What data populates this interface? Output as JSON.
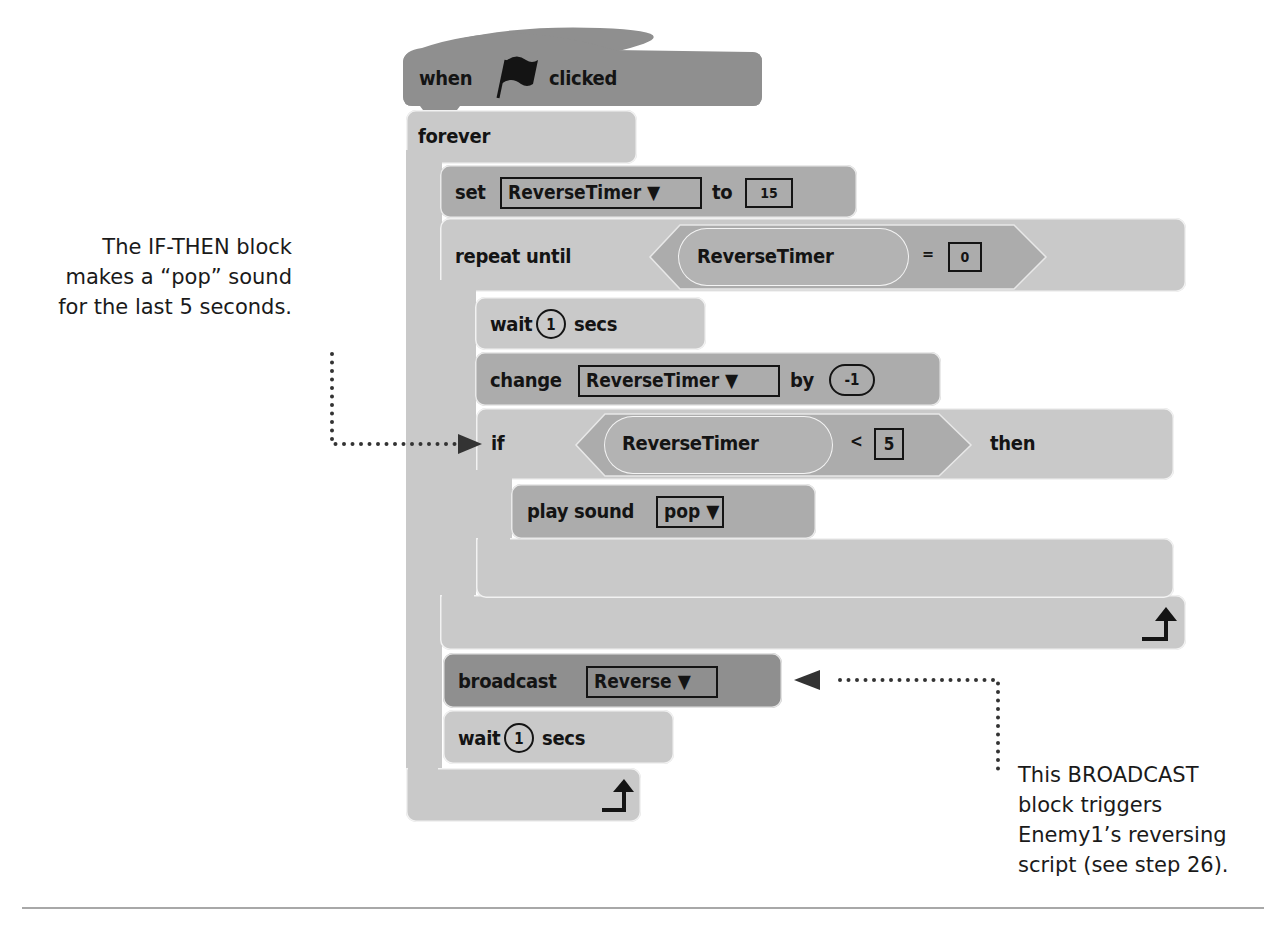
{
  "script": {
    "hat": {
      "when": "when",
      "icon": "green-flag-icon",
      "clicked": "clicked"
    },
    "forever": {
      "label": "forever"
    },
    "set": {
      "label": "set",
      "variable": "ReverseTimer ▼",
      "to": "to",
      "value": "15"
    },
    "repeat_until": {
      "label": "repeat until",
      "condition": {
        "reporter": "ReverseTimer",
        "operator": "=",
        "value": "0"
      }
    },
    "wait_inner": {
      "label": "wait",
      "value": "1",
      "unit": "secs"
    },
    "change": {
      "label": "change",
      "variable": "ReverseTimer ▼",
      "by": "by",
      "value": "-1"
    },
    "if_then": {
      "if": "if",
      "condition": {
        "reporter": "ReverseTimer",
        "operator": "<",
        "value": "5"
      },
      "then": "then"
    },
    "play_sound": {
      "label": "play sound",
      "sound": "pop ▼"
    },
    "broadcast": {
      "label": "broadcast",
      "message": "Reverse ▼"
    },
    "wait_outer": {
      "label": "wait",
      "value": "1",
      "unit": "secs"
    },
    "loop_icon": "loop-arrow-icon"
  },
  "annotations": {
    "left": {
      "lines": [
        "The IF-THEN block",
        "makes a “pop” sound",
        "for the last 5 seconds."
      ]
    },
    "right": {
      "lines": [
        "This BROADCAST",
        "block triggers",
        "Enemy1’s reversing",
        "script (see step 26)."
      ]
    }
  },
  "colors": {
    "control_block": "#c9c9c9",
    "data_block": "#acacac",
    "event_block": "#8f8f8f",
    "text": "#141414"
  }
}
